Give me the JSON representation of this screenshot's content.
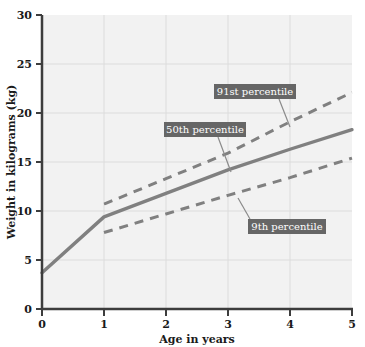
{
  "chart_data": {
    "type": "line",
    "title": "",
    "xlabel": "Age in years",
    "ylabel": "Weight in kilograms (kg)",
    "xlim": [
      0,
      5
    ],
    "ylim": [
      0,
      30
    ],
    "xticks": [
      "0",
      "1",
      "2",
      "3",
      "4",
      "5"
    ],
    "yticks": [
      "0",
      "5",
      "10",
      "15",
      "20",
      "25",
      "30"
    ],
    "grid": true,
    "legend_position": "inline-callouts",
    "plot_background": "#f2f2f2",
    "grid_color": "#d9d9d9",
    "axis_color": "#3d3d3d",
    "line_color": "#808080",
    "callout_fill": "#666666",
    "callout_text_color": "#ffffff",
    "series": [
      {
        "name": "91st percentile",
        "style": "dashed",
        "x": [
          1,
          2,
          3,
          4,
          5
        ],
        "values": [
          10.7,
          13.3,
          15.9,
          19.1,
          22.1
        ]
      },
      {
        "name": "50th percentile",
        "style": "solid",
        "x": [
          0,
          1,
          2,
          3,
          4,
          5
        ],
        "values": [
          3.7,
          9.4,
          11.8,
          14.2,
          16.3,
          18.3
        ]
      },
      {
        "name": "9th percentile",
        "style": "dashed",
        "x": [
          1,
          2,
          3,
          4,
          5
        ],
        "values": [
          7.8,
          9.7,
          11.6,
          13.4,
          15.4
        ]
      }
    ],
    "annotations": [
      {
        "label": "91st percentile",
        "target_series": "91st percentile"
      },
      {
        "label": "50th percentile",
        "target_series": "50th percentile"
      },
      {
        "label": "9th percentile",
        "target_series": "9th percentile"
      }
    ]
  }
}
